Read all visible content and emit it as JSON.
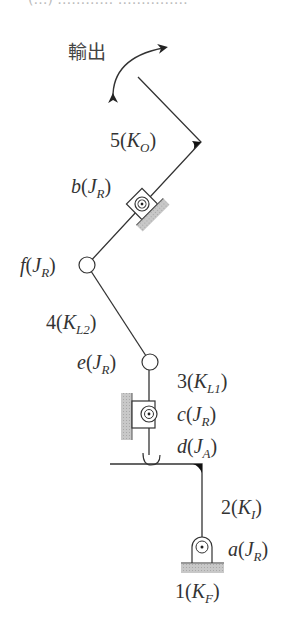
{
  "title": {
    "text": "(…) …………   ……………"
  },
  "output_label": "輸出",
  "links": [
    {
      "id": "1",
      "type": "K_F",
      "num": "1",
      "sub": "F",
      "label": "1(K_F)"
    },
    {
      "id": "2",
      "type": "K_I",
      "num": "2",
      "sub": "I",
      "label": "2(K_I)"
    },
    {
      "id": "3",
      "type": "K_L1",
      "num": "3",
      "sub": "L1",
      "label": "3(K_L1)"
    },
    {
      "id": "4",
      "type": "K_L2",
      "num": "4",
      "sub": "L2",
      "label": "4(K_L2)"
    },
    {
      "id": "5",
      "type": "K_O",
      "num": "5",
      "sub": "O",
      "label": "5(K_O)"
    }
  ],
  "joints": [
    {
      "id": "a",
      "type": "J_R",
      "sub": "R",
      "label": "a(J_R)"
    },
    {
      "id": "b",
      "type": "J_R",
      "sub": "R",
      "label": "b(J_R)"
    },
    {
      "id": "c",
      "type": "J_R",
      "sub": "R",
      "label": "c(J_R)"
    },
    {
      "id": "d",
      "type": "J_A",
      "sub": "A",
      "label": "d(J_A)"
    },
    {
      "id": "e",
      "type": "J_R",
      "sub": "R",
      "label": "e(J_R)"
    },
    {
      "id": "f",
      "type": "J_R",
      "sub": "R",
      "label": "f(J_R)"
    }
  ],
  "colors": {
    "line": "#333333",
    "hatch": "#bdbdbd",
    "text": "#333333"
  }
}
